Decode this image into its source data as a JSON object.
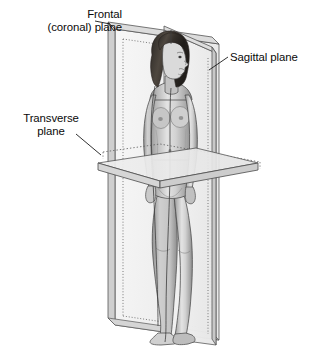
{
  "figure": {
    "background_color": "#ffffff",
    "line_color": "#3c3c3c",
    "plane_fill": "#f2f2f2",
    "plane_edge_fill": "#d8d8d8",
    "text_color": "#0a0a0a"
  },
  "labels": {
    "frontal_line1": "Frontal",
    "frontal_line2": "(coronal) plane",
    "sagittal": "Sagittal plane",
    "transverse_line1": "Transverse",
    "transverse_line2": "plane"
  },
  "planes": [
    {
      "name": "frontal-coronal-plane",
      "label": "Frontal (coronal) plane",
      "orientation": "vertical, parallel to picture plane",
      "divides": "anterior / posterior"
    },
    {
      "name": "sagittal-plane",
      "label": "Sagittal plane",
      "orientation": "vertical, perpendicular to picture plane",
      "divides": "left / right"
    },
    {
      "name": "transverse-plane",
      "label": "Transverse plane",
      "orientation": "horizontal, at hip level",
      "divides": "superior / inferior"
    }
  ]
}
